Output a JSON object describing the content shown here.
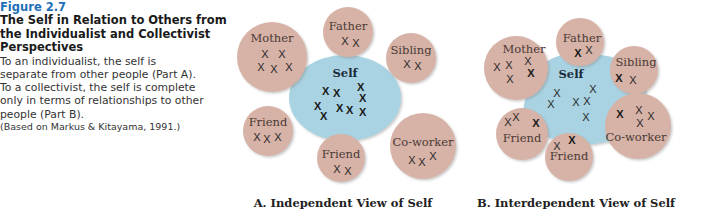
{
  "caption": {
    "figure_number": "Figure 2.7",
    "title_lines": [
      "The Self in Relation to Others from",
      "the Individualist and Collectivist",
      "Perspectives"
    ],
    "body_lines": [
      "To an individualist, the self is",
      "separate from other people (Part A).",
      "To a collectivist, the self is complete",
      "only in terms of relationships to other",
      "people (Part B)."
    ],
    "citation": "(Based on Markus & Kitayama, 1991.)"
  },
  "colors": {
    "figure_number": "#1d6fb8",
    "other_circle": "#d7b2a6",
    "self_circle": "#a9d3e2"
  },
  "part_a": {
    "title": "A. Independent View of Self",
    "self_label": "Self",
    "others": {
      "mother": "Mother",
      "father": "Father",
      "sibling": "Sibling",
      "friend_left": "Friend",
      "friend_bottom": "Friend",
      "coworker": "Co-worker"
    },
    "mark": "X"
  },
  "part_b": {
    "title": "B. Interdependent View of Self",
    "self_label": "Self",
    "others": {
      "mother": "Mother",
      "father": "Father",
      "sibling": "Sibling",
      "friend_left": "Friend",
      "friend_bottom": "Friend",
      "coworker": "Co-worker"
    },
    "mark": "X"
  }
}
